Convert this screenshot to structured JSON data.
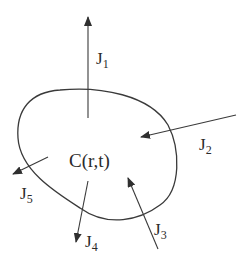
{
  "diagram": {
    "region_label": "C(r,t)",
    "fluxes": [
      {
        "id": "J1",
        "main": "J",
        "sub": "1",
        "direction": "outward"
      },
      {
        "id": "J2",
        "main": "J",
        "sub": "2",
        "direction": "inward"
      },
      {
        "id": "J3",
        "main": "J",
        "sub": "3",
        "direction": "inward"
      },
      {
        "id": "J4",
        "main": "J",
        "sub": "4",
        "direction": "outward"
      },
      {
        "id": "J5",
        "main": "J",
        "sub": "5",
        "direction": "outward"
      }
    ],
    "colors": {
      "stroke": "#3a3a3a",
      "text": "#2a2a2a",
      "background": "#ffffff"
    }
  }
}
